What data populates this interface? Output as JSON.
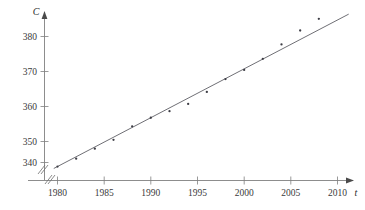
{
  "chart_data": {
    "type": "scatter",
    "title": "",
    "xlabel": "t",
    "ylabel": "C",
    "xlim": [
      1978.6,
      2011.5
    ],
    "ylim": [
      336.0,
      384.5
    ],
    "grid": false,
    "legend": "none",
    "axis_break_x": true,
    "axis_break_y": true,
    "x_ticks": [
      1980,
      1985,
      1990,
      1995,
      2000,
      2005,
      2010
    ],
    "x_tick_labels": [
      "1980",
      "1985",
      "1990",
      "1995",
      "2000",
      "2005",
      "2010"
    ],
    "y_ticks": [
      340,
      350,
      360,
      370,
      380
    ],
    "y_tick_labels": [
      "340",
      "350",
      "360",
      "370",
      "380"
    ],
    "x": [
      1980,
      1982,
      1984,
      1986,
      1988,
      1990,
      1992,
      1994,
      1996,
      1998,
      2000,
      2002,
      2004,
      2006,
      2008
    ],
    "values": [
      338.7,
      341.2,
      344.4,
      347.2,
      351.5,
      354.2,
      356.3,
      358.6,
      362.4,
      366.5,
      369.4,
      372.9,
      377.5,
      381.9,
      385.6
    ],
    "series": [
      {
        "name": "observed",
        "type": "scatter",
        "marker": "dot",
        "color": "#3c3c44",
        "values": [
          338.7,
          341.2,
          344.4,
          347.2,
          351.5,
          354.2,
          356.3,
          358.6,
          362.4,
          366.5,
          369.4,
          372.9,
          377.5,
          381.9,
          385.6
        ]
      },
      {
        "name": "regression-line",
        "type": "line",
        "color": "#55555c",
        "endpoints_x": [
          1979.6,
          2011.2
        ],
        "endpoints_y": [
          338.1,
          387.1
        ],
        "slope": 1.55,
        "intercept_year": 1980,
        "intercept_value": 338.7
      }
    ],
    "annotations": []
  },
  "axes": {
    "y_axis_symbol": "C",
    "x_axis_symbol": "t"
  }
}
